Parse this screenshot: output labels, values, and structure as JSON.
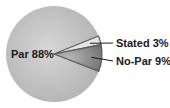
{
  "chart_data": {
    "type": "pie",
    "title": "",
    "categories": [
      "Par",
      "Stated",
      "No-Par"
    ],
    "values": [
      88,
      3,
      9
    ],
    "labels": [
      "Par 88%",
      "Stated 3%",
      "No-Par 9%"
    ],
    "colors": {
      "Par": "#c4c4c4",
      "Stated": "#e4e4e4",
      "No-Par": "#8e8e8e",
      "outline": "#5a5a5a",
      "leader": "#1a1a1a"
    },
    "legend": "none",
    "label_position": "outside-right-with-leaders"
  }
}
